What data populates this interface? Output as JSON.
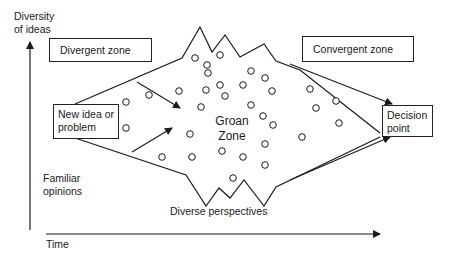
{
  "diagram": {
    "y_axis_label_line1": "Diversity",
    "y_axis_label_line2": "of ideas",
    "x_axis_label": "Time",
    "zones": {
      "divergent": "Divergent zone",
      "convergent": "Convergent zone",
      "groan_line1": "Groan",
      "groan_line2": "Zone"
    },
    "start_box": {
      "line1": "New idea or",
      "line2": "problem"
    },
    "end_box": {
      "line1": "Decision",
      "line2": "point"
    },
    "familiar_line1": "Familiar",
    "familiar_line2": "opinions",
    "diverse_perspectives": "Diverse perspectives",
    "colors": {
      "stroke": "#1a1a1a",
      "background": "#ffffff"
    },
    "ideas": [
      [
        126,
        102
      ],
      [
        126,
        128
      ],
      [
        149,
        95
      ],
      [
        179,
        91
      ],
      [
        195,
        58
      ],
      [
        207,
        65
      ],
      [
        208,
        73
      ],
      [
        220,
        55
      ],
      [
        206,
        90
      ],
      [
        220,
        85
      ],
      [
        225,
        96
      ],
      [
        243,
        85
      ],
      [
        251,
        71
      ],
      [
        265,
        78
      ],
      [
        272,
        91
      ],
      [
        201,
        107
      ],
      [
        251,
        105
      ],
      [
        263,
        116
      ],
      [
        273,
        125
      ],
      [
        190,
        134
      ],
      [
        265,
        144
      ],
      [
        162,
        157
      ],
      [
        192,
        157
      ],
      [
        222,
        151
      ],
      [
        243,
        157
      ],
      [
        265,
        165
      ],
      [
        233,
        178
      ],
      [
        310,
        89
      ],
      [
        336,
        101
      ],
      [
        316,
        108
      ],
      [
        339,
        123
      ],
      [
        302,
        137
      ]
    ]
  }
}
